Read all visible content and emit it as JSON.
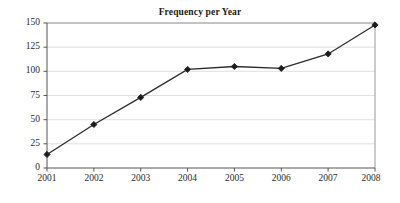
{
  "chart_data": {
    "type": "line",
    "title": "Frequency per Year",
    "xlabel": "",
    "ylabel": "",
    "categories": [
      "2001",
      "2002",
      "2003",
      "2004",
      "2005",
      "2006",
      "2007",
      "2008"
    ],
    "x": [
      2001,
      2002,
      2003,
      2004,
      2005,
      2006,
      2007,
      2008
    ],
    "values": [
      14,
      45,
      73,
      102,
      105,
      103,
      118,
      148
    ],
    "series": [
      {
        "name": "Frequency",
        "values": [
          14,
          45,
          73,
          102,
          105,
          103,
          118,
          148
        ]
      }
    ],
    "ylim": [
      0,
      150
    ],
    "yticks": [
      0,
      25,
      50,
      75,
      100,
      125,
      150
    ],
    "ytick_labels": [
      "0",
      "25",
      "50",
      "75",
      "100",
      "125",
      "150"
    ],
    "xtick_labels": [
      "2001",
      "2002",
      "2003",
      "2004",
      "2005",
      "2006",
      "2007",
      "2008"
    ],
    "grid": true,
    "grid_axis": "y",
    "legend": false,
    "legend_position": "none",
    "marker": "diamond",
    "colors": {
      "line": "#2b2b2b",
      "marker": "#1c1c1c",
      "gridline": "#d8d8d8",
      "axis": "#555555",
      "frame": "#8d8d8d",
      "background": "#ffffff",
      "text": "#1a1a1a"
    }
  }
}
